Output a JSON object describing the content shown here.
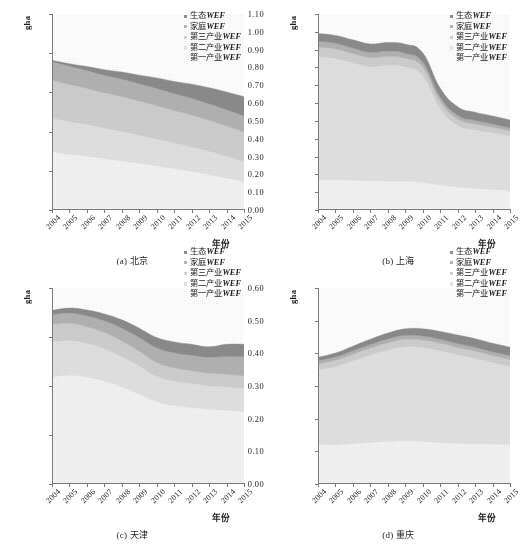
{
  "figure": {
    "series_colors": {
      "eco": "#8c8c8c",
      "household": "#b3b3b3",
      "tertiary": "#cfcfcf",
      "secondary": "#e2e2e2",
      "primary": "#f4f4f4"
    },
    "legend_labels": [
      "生态WEF",
      "家庭WEF",
      "第三产业WEF",
      "第二产业WEF",
      "第一产业WEF"
    ],
    "y_axis_label": "gha",
    "x_axis_label": "年份"
  },
  "chart_data": [
    {
      "type": "area",
      "panel": "a",
      "title": "(a) 北京",
      "xlabel": "年份",
      "ylabel": "gha",
      "ylim": [
        0.0,
        0.5
      ],
      "yticks": [
        "0.00",
        "0.10",
        "0.20",
        "0.30",
        "0.40",
        "0.50"
      ],
      "categories": [
        "2004",
        "2005",
        "2006",
        "2007",
        "2008",
        "2009",
        "2010",
        "2011",
        "2012",
        "2013",
        "2014",
        "2015"
      ],
      "grid": false,
      "legend_position": "top-right",
      "stacked": true,
      "series": [
        {
          "name": "第一产业WEF",
          "values": [
            0.148,
            0.142,
            0.137,
            0.131,
            0.125,
            0.119,
            0.112,
            0.105,
            0.098,
            0.09,
            0.081,
            0.072
          ]
        },
        {
          "name": "第二产业WEF",
          "values": [
            0.087,
            0.084,
            0.081,
            0.078,
            0.075,
            0.072,
            0.069,
            0.066,
            0.063,
            0.06,
            0.056,
            0.052
          ]
        },
        {
          "name": "第三产业WEF",
          "values": [
            0.096,
            0.094,
            0.092,
            0.09,
            0.089,
            0.087,
            0.085,
            0.083,
            0.081,
            0.079,
            0.077,
            0.075
          ]
        },
        {
          "name": "家庭WEF",
          "values": [
            0.048,
            0.047,
            0.046,
            0.045,
            0.045,
            0.044,
            0.044,
            0.043,
            0.043,
            0.042,
            0.042,
            0.041
          ]
        },
        {
          "name": "生态WEF",
          "values": [
            0.003,
            0.006,
            0.01,
            0.014,
            0.018,
            0.022,
            0.027,
            0.031,
            0.036,
            0.041,
            0.045,
            0.049
          ]
        }
      ],
      "totals": [
        0.382,
        0.373,
        0.366,
        0.358,
        0.352,
        0.344,
        0.337,
        0.328,
        0.321,
        0.312,
        0.301,
        0.289
      ]
    },
    {
      "type": "area",
      "panel": "b",
      "title": "(b) 上海",
      "xlabel": "年份",
      "ylabel": "gha",
      "ylim": [
        0.0,
        1.1
      ],
      "yticks": [
        "0.00",
        "0.10",
        "0.20",
        "0.30",
        "0.40",
        "0.50",
        "0.60",
        "0.70",
        "0.80",
        "0.90",
        "1.00",
        "1.10"
      ],
      "categories": [
        "2004",
        "2005",
        "2006",
        "2007",
        "2008",
        "2009",
        "2010",
        "2011",
        "2012",
        "2013",
        "2014",
        "2015"
      ],
      "grid": false,
      "legend_position": "top-right",
      "stacked": true,
      "series": [
        {
          "name": "第一产业WEF",
          "values": [
            0.17,
            0.168,
            0.166,
            0.164,
            0.162,
            0.16,
            0.155,
            0.14,
            0.128,
            0.12,
            0.113,
            0.107
          ]
        },
        {
          "name": "第二产业WEF",
          "values": [
            0.69,
            0.682,
            0.66,
            0.64,
            0.65,
            0.642,
            0.6,
            0.43,
            0.348,
            0.33,
            0.32,
            0.308
          ]
        },
        {
          "name": "第三产业WEF",
          "values": [
            0.055,
            0.054,
            0.052,
            0.051,
            0.05,
            0.049,
            0.047,
            0.04,
            0.035,
            0.033,
            0.031,
            0.029
          ]
        },
        {
          "name": "家庭WEF",
          "values": [
            0.032,
            0.032,
            0.031,
            0.03,
            0.03,
            0.029,
            0.028,
            0.024,
            0.021,
            0.02,
            0.019,
            0.018
          ]
        },
        {
          "name": "生态WEF",
          "values": [
            0.043,
            0.044,
            0.046,
            0.047,
            0.048,
            0.05,
            0.052,
            0.05,
            0.048,
            0.046,
            0.045,
            0.043
          ]
        }
      ],
      "totals": [
        0.99,
        0.98,
        0.955,
        0.932,
        0.94,
        0.93,
        0.882,
        0.684,
        0.58,
        0.549,
        0.528,
        0.505
      ]
    },
    {
      "type": "area",
      "panel": "c",
      "title": "(c) 天津",
      "xlabel": "年份",
      "ylabel": "gha",
      "ylim": [
        0.0,
        0.4
      ],
      "yticks": [
        "0.00",
        "0.10",
        "0.20",
        "0.30",
        "0.40"
      ],
      "categories": [
        "2004",
        "2005",
        "2006",
        "2007",
        "2008",
        "2009",
        "2010",
        "2011",
        "2012",
        "2013",
        "2014",
        "2015"
      ],
      "grid": false,
      "legend_position": "top-right",
      "stacked": true,
      "series": [
        {
          "name": "第一产业WEF",
          "values": [
            0.218,
            0.222,
            0.218,
            0.21,
            0.198,
            0.183,
            0.168,
            0.16,
            0.156,
            0.152,
            0.15,
            0.148
          ]
        },
        {
          "name": "第二产业WEF",
          "values": [
            0.072,
            0.071,
            0.069,
            0.066,
            0.062,
            0.058,
            0.052,
            0.05,
            0.049,
            0.048,
            0.048,
            0.047
          ]
        },
        {
          "name": "第三产业WEF",
          "values": [
            0.036,
            0.035,
            0.034,
            0.033,
            0.032,
            0.03,
            0.028,
            0.027,
            0.026,
            0.026,
            0.026,
            0.026
          ]
        },
        {
          "name": "家庭WEF",
          "values": [
            0.02,
            0.021,
            0.022,
            0.024,
            0.026,
            0.028,
            0.03,
            0.031,
            0.032,
            0.033,
            0.036,
            0.039
          ]
        },
        {
          "name": "生态WEF",
          "values": [
            0.008,
            0.01,
            0.012,
            0.014,
            0.017,
            0.019,
            0.021,
            0.022,
            0.022,
            0.021,
            0.025,
            0.025
          ]
        }
      ],
      "totals": [
        0.354,
        0.359,
        0.355,
        0.347,
        0.335,
        0.318,
        0.299,
        0.29,
        0.285,
        0.28,
        0.285,
        0.285
      ]
    },
    {
      "type": "area",
      "panel": "d",
      "title": "(d) 重庆",
      "xlabel": "年份",
      "ylabel": "gha",
      "ylim": [
        0.0,
        0.6
      ],
      "yticks": [
        "0.00",
        "0.10",
        "0.20",
        "0.30",
        "0.40",
        "0.50",
        "0.60"
      ],
      "categories": [
        "2004",
        "2005",
        "2006",
        "2007",
        "2008",
        "2009",
        "2010",
        "2011",
        "2012",
        "2013",
        "2014",
        "2015"
      ],
      "grid": false,
      "legend_position": "top-right",
      "stacked": true,
      "series": [
        {
          "name": "第一产业WEF",
          "values": [
            0.122,
            0.12,
            0.123,
            0.127,
            0.13,
            0.132,
            0.13,
            0.126,
            0.124,
            0.123,
            0.122,
            0.122
          ]
        },
        {
          "name": "第二产业WEF",
          "values": [
            0.228,
            0.24,
            0.254,
            0.268,
            0.28,
            0.288,
            0.288,
            0.282,
            0.272,
            0.262,
            0.25,
            0.238
          ]
        },
        {
          "name": "第三产业WEF",
          "values": [
            0.018,
            0.019,
            0.02,
            0.021,
            0.022,
            0.023,
            0.023,
            0.023,
            0.022,
            0.022,
            0.021,
            0.021
          ]
        },
        {
          "name": "家庭WEF",
          "values": [
            0.01,
            0.01,
            0.011,
            0.011,
            0.012,
            0.012,
            0.012,
            0.012,
            0.012,
            0.012,
            0.012,
            0.012
          ]
        },
        {
          "name": "生态WEF",
          "values": [
            0.01,
            0.012,
            0.014,
            0.016,
            0.018,
            0.02,
            0.022,
            0.024,
            0.026,
            0.026,
            0.026,
            0.026
          ]
        }
      ],
      "totals": [
        0.388,
        0.401,
        0.422,
        0.443,
        0.462,
        0.475,
        0.475,
        0.467,
        0.456,
        0.445,
        0.431,
        0.419
      ]
    }
  ]
}
